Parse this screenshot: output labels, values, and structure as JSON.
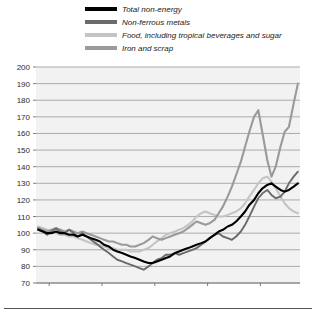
{
  "legend": {
    "position": "top",
    "items": [
      {
        "label": "Total non-energy",
        "color": "#000000"
      },
      {
        "label": "Non-ferrous metals",
        "color": "#6b6b6b"
      },
      {
        "label": "Food, including tropical beverages and sugar",
        "color": "#c4c4c4"
      },
      {
        "label": "Iron and scrap",
        "color": "#9a9a9a"
      }
    ]
  },
  "axes": {
    "y_ticks": [
      "200",
      "190",
      "180",
      "170",
      "160",
      "150",
      "140",
      "130",
      "120",
      "110",
      "100",
      "90",
      "80",
      "70"
    ],
    "x_ticks": [
      "2000",
      "2001",
      "2002",
      "2003",
      "2004"
    ]
  },
  "chart_data": {
    "type": "line",
    "title": "",
    "subtitle": "",
    "xlabel": "",
    "ylabel": "",
    "ylim": [
      70,
      200
    ],
    "xlim": [
      1999.75,
      2004.75
    ],
    "grid": true,
    "legend_position": "top",
    "y_ticks": [
      70,
      80,
      90,
      100,
      110,
      120,
      130,
      140,
      150,
      160,
      170,
      180,
      190,
      200
    ],
    "x_ticks": [
      2000,
      2001,
      2002,
      2003,
      2004
    ],
    "x": [
      1999.79,
      1999.88,
      1999.96,
      2000.04,
      2000.13,
      2000.21,
      2000.29,
      2000.38,
      2000.46,
      2000.54,
      2000.63,
      2000.71,
      2000.79,
      2000.88,
      2000.96,
      2001.04,
      2001.13,
      2001.21,
      2001.29,
      2001.38,
      2001.46,
      2001.54,
      2001.63,
      2001.71,
      2001.79,
      2001.88,
      2001.96,
      2002.04,
      2002.13,
      2002.21,
      2002.29,
      2002.38,
      2002.46,
      2002.54,
      2002.63,
      2002.71,
      2002.79,
      2002.88,
      2002.96,
      2003.04,
      2003.13,
      2003.21,
      2003.29,
      2003.38,
      2003.46,
      2003.54,
      2003.63,
      2003.71,
      2003.79,
      2003.88,
      2003.96,
      2004.04,
      2004.13,
      2004.21,
      2004.29,
      2004.38,
      2004.46,
      2004.54,
      2004.63,
      2004.71
    ],
    "series": [
      {
        "name": "Total non-energy",
        "color": "#000000",
        "width": 2.1,
        "values": [
          102,
          101,
          100,
          100,
          101,
          100,
          100,
          99,
          99,
          98,
          99,
          98,
          97,
          96,
          95,
          93,
          92,
          90,
          89,
          88,
          87,
          86,
          85,
          84,
          83,
          82,
          82,
          83,
          84,
          85,
          86,
          88,
          89,
          90,
          91,
          92,
          93,
          94,
          95,
          97,
          99,
          101,
          102,
          104,
          105,
          107,
          110,
          113,
          117,
          120,
          124,
          127,
          129,
          130,
          128,
          126,
          125,
          126,
          128,
          130
        ]
      },
      {
        "name": "Non-ferrous metals",
        "color": "#6b6b6b",
        "width": 1.9,
        "values": [
          103,
          101,
          99,
          101,
          103,
          101,
          100,
          102,
          100,
          98,
          100,
          98,
          96,
          94,
          92,
          90,
          88,
          86,
          84,
          83,
          82,
          81,
          80,
          79,
          78,
          80,
          82,
          84,
          85,
          87,
          87,
          88,
          87,
          88,
          89,
          90,
          91,
          93,
          95,
          97,
          99,
          100,
          98,
          97,
          96,
          98,
          101,
          105,
          110,
          116,
          121,
          124,
          126,
          123,
          121,
          122,
          125,
          130,
          134,
          137
        ]
      },
      {
        "name": "Food, including tropical beverages and sugar",
        "color": "#c4c4c4",
        "width": 2.1,
        "values": [
          104,
          103,
          102,
          101,
          100,
          99,
          99,
          98,
          98,
          97,
          96,
          95,
          94,
          93,
          93,
          92,
          91,
          91,
          90,
          90,
          90,
          89,
          89,
          89,
          90,
          91,
          93,
          95,
          97,
          99,
          100,
          101,
          102,
          103,
          105,
          107,
          110,
          112,
          113,
          112,
          111,
          110,
          110,
          111,
          112,
          113,
          115,
          118,
          122,
          126,
          130,
          133,
          134,
          131,
          127,
          122,
          118,
          115,
          113,
          112
        ]
      },
      {
        "name": "Iron and scrap",
        "color": "#9a9a9a",
        "width": 2.1,
        "values": [
          103,
          102,
          101,
          102,
          103,
          102,
          101,
          102,
          101,
          100,
          101,
          100,
          99,
          98,
          97,
          96,
          95,
          95,
          94,
          93,
          93,
          92,
          92,
          93,
          94,
          96,
          98,
          97,
          96,
          97,
          98,
          99,
          100,
          101,
          103,
          105,
          107,
          106,
          105,
          106,
          108,
          112,
          116,
          122,
          128,
          135,
          143,
          152,
          161,
          170,
          174,
          160,
          144,
          134,
          140,
          152,
          161,
          164,
          178,
          190
        ]
      }
    ]
  }
}
